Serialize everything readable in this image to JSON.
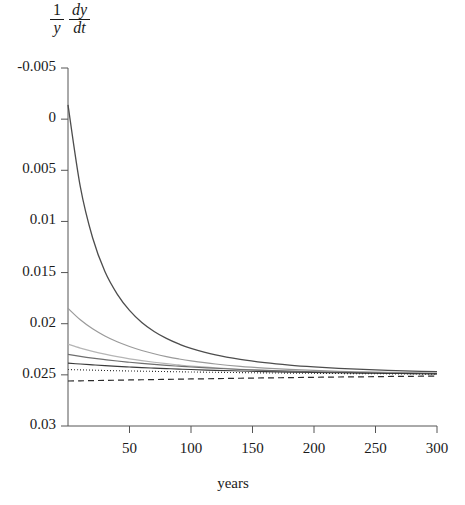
{
  "axes": {
    "y_axis_label_numerator_1": "1",
    "y_axis_label_denominator_1": "y",
    "y_axis_label_numerator_2": "dy",
    "y_axis_label_denominator_2": "dt",
    "x_axis_label": "years",
    "y_ticks": [
      "0.03",
      "0.025",
      "0.02",
      "0.015",
      "0.01",
      "0.005",
      "0",
      "-0.005"
    ],
    "x_ticks": [
      "50",
      "100",
      "150",
      "200",
      "250",
      "300"
    ]
  },
  "chart_data": {
    "type": "line",
    "title": "",
    "xlabel": "years",
    "ylabel": "1/y dy/dt",
    "xlim": [
      0,
      300
    ],
    "ylim": [
      -0.005,
      0.03
    ],
    "yticks": [
      -0.005,
      0,
      0.005,
      0.01,
      0.015,
      0.02,
      0.025,
      0.03
    ],
    "xticks": [
      50,
      100,
      150,
      200,
      250,
      300
    ],
    "grid": false,
    "legend": "none",
    "x": [
      0,
      10,
      20,
      30,
      40,
      50,
      60,
      70,
      80,
      90,
      100,
      120,
      140,
      160,
      180,
      200,
      220,
      240,
      260,
      280,
      300
    ],
    "series": [
      {
        "name": "curve-1",
        "style": "solid",
        "color": "#4d4d4d",
        "width": 1.3,
        "values": [
          0.0264,
          0.0184,
          0.0134,
          0.0101,
          0.0079,
          0.0063,
          0.00512,
          0.00424,
          0.00356,
          0.00302,
          0.00259,
          0.00196,
          0.00152,
          0.0012,
          0.00096,
          0.00078,
          0.00064,
          0.00053,
          0.00044,
          0.00037,
          0.00031
        ]
      },
      {
        "name": "curve-2",
        "style": "solid",
        "color": "#9a9a9a",
        "width": 1.2,
        "values": [
          0.0065,
          0.00538,
          0.0045,
          0.0038,
          0.00323,
          0.00277,
          0.00238,
          0.00206,
          0.00179,
          0.00156,
          0.00137,
          0.00106,
          0.00083,
          0.00066,
          0.00053,
          0.00043,
          0.00035,
          0.00029,
          0.00024,
          0.0002,
          0.00017
        ]
      },
      {
        "name": "curve-3",
        "style": "solid",
        "color": "#b5b5b5",
        "width": 1.2,
        "values": [
          0.003,
          0.00262,
          0.0023,
          0.00202,
          0.00178,
          0.00157,
          0.00139,
          0.00123,
          0.00109,
          0.00097,
          0.00086,
          0.00069,
          0.00055,
          0.00044,
          0.00036,
          0.00029,
          0.00023,
          0.00019,
          0.00016,
          0.00013,
          0.00011
        ]
      },
      {
        "name": "curve-4",
        "style": "solid",
        "color": "#6e6e6e",
        "width": 1.1,
        "values": [
          0.002,
          0.00181,
          0.00164,
          0.00149,
          0.00135,
          0.00123,
          0.00112,
          0.00102,
          0.00093,
          0.00085,
          0.00077,
          0.00064,
          0.00053,
          0.00044,
          0.00037,
          0.00031,
          0.00026,
          0.00021,
          0.00018,
          0.00015,
          0.00012
        ]
      },
      {
        "name": "curve-5",
        "style": "solid",
        "color": "#3a3a3a",
        "width": 1.1,
        "values": [
          0.00115,
          0.00106,
          0.00098,
          0.0009,
          0.00083,
          0.00077,
          0.00071,
          0.00066,
          0.00061,
          0.00056,
          0.00052,
          0.00044,
          0.00038,
          0.00032,
          0.00027,
          0.00023,
          0.0002,
          0.00017,
          0.00014,
          0.00012,
          0.0001
        ]
      },
      {
        "name": "curve-6-dotted",
        "style": "dotted",
        "color": "#2b2b2b",
        "width": 1.1,
        "values": [
          0.00052,
          0.00049,
          0.00046,
          0.00043,
          0.0004,
          0.00038,
          0.00036,
          0.00034,
          0.00032,
          0.0003,
          0.00028,
          0.00025,
          0.00022,
          0.00019,
          0.00017,
          0.00015,
          0.00013,
          0.00011,
          0.0001,
          8e-05,
          7e-05
        ]
      },
      {
        "name": "curve-7-dashed",
        "style": "dashed",
        "color": "#2b2b2b",
        "width": 1.2,
        "values": [
          -0.0006,
          -0.00058,
          -0.00056,
          -0.00054,
          -0.00052,
          -0.0005,
          -0.00048,
          -0.00046,
          -0.00044,
          -0.00042,
          -0.0004,
          -0.00037,
          -0.00033,
          -0.0003,
          -0.00027,
          -0.00024,
          -0.00021,
          -0.00019,
          -0.00016,
          -0.00014,
          -0.00012
        ]
      }
    ]
  }
}
